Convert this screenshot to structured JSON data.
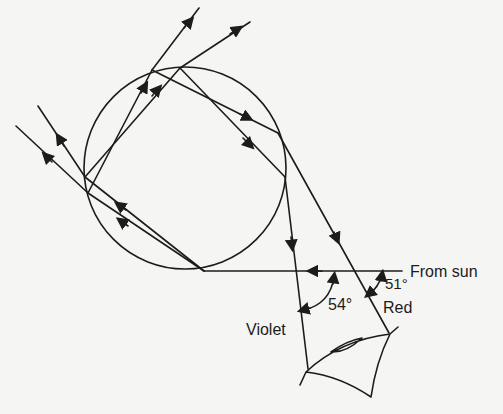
{
  "diagram": {
    "labels": {
      "from_sun": "From sun",
      "red": "Red",
      "violet": "Violet",
      "angle_red": "51°",
      "angle_violet": "54°"
    },
    "colors": {
      "ink": "#1c1c1c",
      "background": "#f5f5f3"
    },
    "elements": [
      "raindrop-circle",
      "sun-ray",
      "internal-reflection-rays",
      "red-ray",
      "violet-ray",
      "eye",
      "angle-arcs",
      "direction-arrows"
    ]
  }
}
